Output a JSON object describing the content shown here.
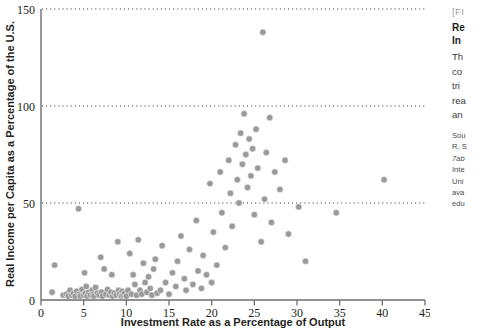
{
  "figure": {
    "fig_number": "[FI",
    "title_line_1": "Re",
    "title_line_2": "In",
    "body_lines": [
      "Th",
      "co",
      "tri",
      "rea",
      "an"
    ],
    "source_lines": [
      "Sou",
      "R. S",
      "7ab",
      "Inte",
      "Uni",
      "ava",
      "edu"
    ]
  },
  "chart_data": {
    "type": "scatter",
    "title": "",
    "xlabel": "Investment Rate as a Percentage of Output",
    "ylabel": "Real Income per Capita as a Percentage of the U.S.",
    "xlim": [
      0,
      45
    ],
    "ylim": [
      0,
      150
    ],
    "xticks": [
      0,
      5,
      10,
      15,
      20,
      25,
      30,
      35,
      40,
      45
    ],
    "yticks": [
      0,
      50,
      100,
      150
    ],
    "gridlines": {
      "y": [
        50,
        100,
        150
      ],
      "style": "dotted",
      "x": []
    },
    "legend": "none",
    "marker": {
      "shape": "circle",
      "color": "#9a9a9a",
      "size": 3.2
    },
    "points": [
      [
        1.3,
        4.0
      ],
      [
        1.6,
        18.0
      ],
      [
        2.6,
        2.5
      ],
      [
        3.0,
        3.0
      ],
      [
        3.2,
        2.0
      ],
      [
        3.4,
        5.0
      ],
      [
        3.6,
        2.5
      ],
      [
        3.8,
        3.5
      ],
      [
        4.0,
        2.0
      ],
      [
        4.2,
        4.5
      ],
      [
        4.4,
        47.0
      ],
      [
        4.5,
        3.0
      ],
      [
        4.6,
        2.0
      ],
      [
        4.8,
        5.5
      ],
      [
        5.0,
        2.5
      ],
      [
        5.1,
        14.0
      ],
      [
        5.2,
        3.5
      ],
      [
        5.3,
        7.0
      ],
      [
        5.4,
        2.0
      ],
      [
        5.6,
        4.0
      ],
      [
        5.8,
        2.5
      ],
      [
        6.0,
        5.0
      ],
      [
        6.1,
        3.0
      ],
      [
        6.2,
        2.0
      ],
      [
        6.4,
        6.5
      ],
      [
        6.6,
        3.5
      ],
      [
        6.8,
        2.5
      ],
      [
        7.0,
        22.0
      ],
      [
        7.1,
        4.0
      ],
      [
        7.2,
        2.0
      ],
      [
        7.4,
        16.0
      ],
      [
        7.6,
        3.0
      ],
      [
        7.8,
        5.5
      ],
      [
        8.0,
        2.5
      ],
      [
        8.2,
        4.0
      ],
      [
        8.3,
        13.0
      ],
      [
        8.4,
        2.0
      ],
      [
        8.6,
        3.5
      ],
      [
        8.8,
        2.5
      ],
      [
        9.0,
        30.0
      ],
      [
        9.1,
        5.0
      ],
      [
        9.2,
        3.0
      ],
      [
        9.4,
        2.0
      ],
      [
        9.5,
        4.5
      ],
      [
        9.6,
        2.5
      ],
      [
        9.8,
        3.5
      ],
      [
        10.0,
        2.0
      ],
      [
        10.2,
        5.0
      ],
      [
        10.4,
        24.0
      ],
      [
        10.6,
        3.0
      ],
      [
        10.8,
        13.0
      ],
      [
        11.0,
        8.0
      ],
      [
        11.2,
        2.5
      ],
      [
        11.4,
        31.0
      ],
      [
        11.6,
        5.0
      ],
      [
        11.8,
        3.0
      ],
      [
        12.0,
        19.0
      ],
      [
        12.2,
        9.0
      ],
      [
        12.4,
        4.0
      ],
      [
        12.6,
        12.0
      ],
      [
        12.8,
        6.0
      ],
      [
        13.0,
        2.5
      ],
      [
        13.2,
        16.0
      ],
      [
        13.4,
        21.0
      ],
      [
        13.6,
        3.5
      ],
      [
        14.0,
        5.0
      ],
      [
        14.2,
        28.0
      ],
      [
        14.6,
        9.0
      ],
      [
        15.0,
        3.0
      ],
      [
        15.4,
        14.0
      ],
      [
        15.8,
        7.0
      ],
      [
        16.0,
        20.0
      ],
      [
        16.4,
        33.0
      ],
      [
        16.8,
        11.0
      ],
      [
        17.0,
        5.0
      ],
      [
        17.4,
        26.0
      ],
      [
        17.8,
        8.0
      ],
      [
        18.2,
        41.0
      ],
      [
        18.4,
        15.0
      ],
      [
        18.8,
        6.0
      ],
      [
        19.0,
        23.0
      ],
      [
        19.4,
        13.0
      ],
      [
        19.8,
        60.0
      ],
      [
        20.0,
        9.0
      ],
      [
        20.2,
        35.0
      ],
      [
        20.6,
        18.0
      ],
      [
        21.0,
        66.0
      ],
      [
        21.2,
        45.0
      ],
      [
        21.6,
        27.0
      ],
      [
        22.0,
        72.0
      ],
      [
        22.2,
        55.0
      ],
      [
        22.4,
        38.0
      ],
      [
        22.8,
        80.0
      ],
      [
        23.0,
        62.0
      ],
      [
        23.2,
        50.0
      ],
      [
        23.4,
        86.0
      ],
      [
        23.6,
        70.0
      ],
      [
        23.8,
        96.0
      ],
      [
        24.0,
        75.0
      ],
      [
        24.2,
        58.0
      ],
      [
        24.4,
        83.0
      ],
      [
        24.6,
        64.0
      ],
      [
        24.8,
        78.0
      ],
      [
        25.0,
        44.0
      ],
      [
        25.2,
        88.0
      ],
      [
        25.4,
        68.0
      ],
      [
        25.8,
        30.0
      ],
      [
        26.0,
        138.0
      ],
      [
        26.2,
        52.0
      ],
      [
        26.4,
        76.0
      ],
      [
        26.8,
        94.0
      ],
      [
        27.0,
        40.0
      ],
      [
        27.4,
        66.0
      ],
      [
        28.0,
        57.0
      ],
      [
        28.6,
        72.0
      ],
      [
        29.0,
        34.0
      ],
      [
        30.2,
        48.0
      ],
      [
        31.0,
        20.0
      ],
      [
        34.6,
        45.0
      ],
      [
        40.2,
        62.0
      ]
    ]
  }
}
